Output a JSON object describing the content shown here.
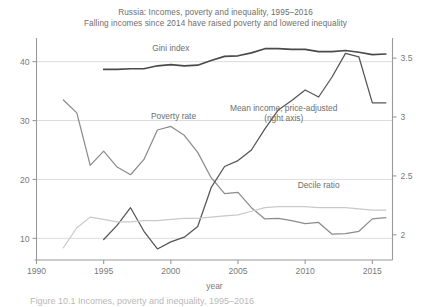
{
  "chart_data": {
    "type": "line",
    "title": "Russia: Incomes, poverty and inequality, 1995–2016",
    "subtitle": "Falling incomes since 2014 have raised poverty and lowered inequality",
    "xlabel": "year",
    "ylabel": "",
    "xlim": [
      1990,
      2016.5
    ],
    "ylim": [
      7.0,
      43.0
    ],
    "ylim_right": [
      1.82,
      3.62
    ],
    "xticks": [
      1990,
      1995,
      2000,
      2005,
      2010,
      2015
    ],
    "yticks_left": [
      10,
      20,
      30,
      40
    ],
    "yticks_right": [
      2,
      2.5,
      3,
      3.5
    ],
    "grid": "horizontal",
    "legend": "inline-annotations",
    "series": [
      {
        "name": "Gini index",
        "axis": "left",
        "color": "#4a4a4a",
        "label_x": 2000.0,
        "label_y": 41.8,
        "x": [
          1995,
          1996,
          1997,
          1998,
          1999,
          2000,
          2001,
          2002,
          2003,
          2004,
          2005,
          2006,
          2007,
          2008,
          2009,
          2010,
          2011,
          2012,
          2013,
          2014,
          2015,
          2016
        ],
        "values": [
          38.7,
          38.7,
          38.8,
          38.8,
          39.3,
          39.5,
          39.3,
          39.4,
          40.2,
          40.9,
          41.0,
          41.5,
          42.2,
          42.2,
          42.1,
          42.1,
          41.7,
          41.7,
          41.9,
          41.6,
          41.2,
          41.3
        ]
      },
      {
        "name": "Poverty rate",
        "axis": "left",
        "color": "#8c8c8c",
        "label_x": 2000.2,
        "label_y": 30.2,
        "x": [
          1992,
          1993,
          1994,
          1995,
          1996,
          1997,
          1998,
          1999,
          2000,
          2001,
          2002,
          2003,
          2004,
          2005,
          2006,
          2007,
          2008,
          2009,
          2010,
          2011,
          2012,
          2013,
          2014,
          2015,
          2016
        ],
        "values": [
          33.5,
          31.3,
          22.4,
          24.8,
          22.1,
          20.8,
          23.4,
          28.4,
          29.0,
          27.5,
          24.6,
          20.3,
          17.6,
          17.8,
          15.2,
          13.3,
          13.4,
          13.0,
          12.5,
          12.7,
          10.7,
          10.8,
          11.2,
          13.3,
          13.5
        ]
      },
      {
        "name": "Mean income, price-adjusted",
        "axis": "right",
        "color": "#555555",
        "label_x": 2008.4,
        "label_y_right": 3.05,
        "label_line2": "(right axis)",
        "x": [
          1995,
          1996,
          1997,
          1998,
          1999,
          2000,
          2001,
          2002,
          2003,
          2004,
          2005,
          2006,
          2007,
          2008,
          2009,
          2010,
          2011,
          2012,
          2013,
          2014,
          2015,
          2016
        ],
        "values": [
          1.96,
          2.08,
          2.23,
          2.03,
          1.88,
          1.94,
          1.98,
          2.07,
          2.4,
          2.58,
          2.63,
          2.72,
          2.9,
          3.06,
          3.14,
          3.23,
          3.17,
          3.34,
          3.54,
          3.51,
          3.12,
          3.12
        ]
      },
      {
        "name": "Decile ratio",
        "axis": "right",
        "color": "#c9c9c9",
        "label_x": 2011.0,
        "label_y_right": 2.4,
        "x": [
          1992,
          1993,
          1994,
          1995,
          1996,
          1997,
          1998,
          1999,
          2000,
          2001,
          2002,
          2003,
          2004,
          2005,
          2006,
          2007,
          2008,
          2009,
          2010,
          2011,
          2012,
          2013,
          2014,
          2015,
          2016
        ],
        "values": [
          1.89,
          2.06,
          2.15,
          2.13,
          2.11,
          2.11,
          2.12,
          2.12,
          2.13,
          2.14,
          2.14,
          2.15,
          2.16,
          2.17,
          2.2,
          2.23,
          2.24,
          2.24,
          2.24,
          2.23,
          2.23,
          2.23,
          2.22,
          2.21,
          2.21
        ]
      }
    ],
    "annotations": [
      {
        "text": "Gini index"
      },
      {
        "text": "Poverty rate"
      },
      {
        "text": "Mean income, price-adjusted"
      },
      {
        "text": "(right axis)"
      },
      {
        "text": "Decile ratio"
      }
    ]
  },
  "caption": "Figure 10.1 Incomes, poverty and inequality, 1995–2016"
}
